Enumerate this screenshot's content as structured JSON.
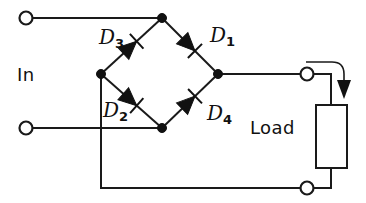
{
  "diagram": {
    "type": "circuit-schematic",
    "background_color": "#ffffff",
    "line_color": "#1a1a1a",
    "labels": {
      "input": "In",
      "load": "Load",
      "diode_1": "D",
      "diode_1_sub": "1",
      "diode_2": "D",
      "diode_2_sub": "2",
      "diode_3": "D",
      "diode_3_sub": "3",
      "diode_4": "D",
      "diode_4_sub": "4"
    },
    "components": [
      {
        "name": "diode-d1",
        "label": "D1",
        "orientation": "down-right",
        "from": "top-node",
        "to": "right-node"
      },
      {
        "name": "diode-d2",
        "label": "D2",
        "orientation": "down-right",
        "from": "left-node",
        "to": "bottom-node"
      },
      {
        "name": "diode-d3",
        "label": "D3",
        "orientation": "up-right",
        "from": "left-node",
        "to": "top-node"
      },
      {
        "name": "diode-d4",
        "label": "D4",
        "orientation": "up-right",
        "from": "bottom-node",
        "to": "right-node"
      },
      {
        "name": "load-resistor",
        "label": "Load",
        "shape": "rectangle"
      }
    ],
    "terminals": [
      {
        "name": "input-terminal-top",
        "x": 25,
        "y": 18
      },
      {
        "name": "input-terminal-bottom",
        "x": 25,
        "y": 128
      },
      {
        "name": "output-terminal-top",
        "x": 305,
        "y": 73
      },
      {
        "name": "output-terminal-bottom",
        "x": 305,
        "y": 188
      }
    ],
    "nodes": [
      {
        "name": "bridge-node-top",
        "x": 162,
        "y": 18
      },
      {
        "name": "bridge-node-left",
        "x": 101,
        "y": 74
      },
      {
        "name": "bridge-node-right",
        "x": 218,
        "y": 74
      },
      {
        "name": "bridge-node-bottom",
        "x": 162,
        "y": 128
      }
    ],
    "annotations": [
      {
        "name": "current-direction-arrow",
        "description": "curved arrow into load, pointing down"
      }
    ]
  }
}
